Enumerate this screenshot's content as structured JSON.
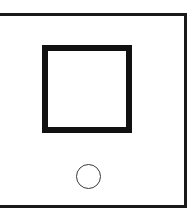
{
  "figure": {
    "background_color": "#ffffff",
    "canvas": {
      "width": 195,
      "height": 220
    },
    "frame": {
      "name": "outer-frame",
      "shape": "rectangle",
      "style": "outline",
      "stroke_color": "#1a1a1a",
      "stroke_width": 3,
      "left": -6,
      "top": 13,
      "width": 193,
      "height": 195,
      "note": "left edge cropped off image"
    },
    "shapes": [
      {
        "name": "square-shape",
        "shape": "square",
        "style": "outline",
        "stroke_color": "#111111",
        "stroke_width": 6,
        "fill": "none",
        "left": 42,
        "top": 45,
        "width": 90,
        "height": 88
      },
      {
        "name": "circle-shape",
        "shape": "circle",
        "style": "outline",
        "stroke_color": "#3a3a3a",
        "stroke_width": 1.5,
        "fill": "none",
        "left": 76,
        "top": 164,
        "width": 25,
        "height": 25,
        "center_x": 88,
        "center_y": 176,
        "radius": 12
      }
    ]
  }
}
